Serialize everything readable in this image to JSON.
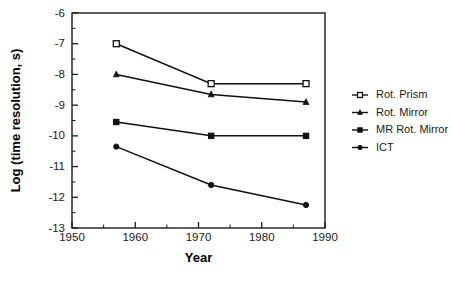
{
  "chart_data": {
    "type": "line",
    "title": "",
    "xlabel": "Year",
    "ylabel": "Log (time resolution, s)",
    "xlim": [
      1950,
      1990
    ],
    "ylim": [
      -13,
      -6
    ],
    "x_ticks": [
      1950,
      1960,
      1970,
      1980,
      1990
    ],
    "x_tick_labels": [
      "1950",
      "1960",
      "1970",
      "1980",
      "1990"
    ],
    "x_minor_ticks": [
      1955,
      1965,
      1975,
      1985
    ],
    "y_ticks": [
      -6,
      -7,
      -8,
      -9,
      -10,
      -11,
      -12,
      -13
    ],
    "y_tick_labels": [
      "-6",
      "-7",
      "-8",
      "-9",
      "-10",
      "-11",
      "-12",
      "-13"
    ],
    "y_minor_ticks": [
      -6.5,
      -7.5,
      -8.5,
      -9.5,
      -10.5,
      -11.5,
      -12.5
    ],
    "grid": false,
    "legend_position": "right",
    "series": [
      {
        "name": "Rot. Prism",
        "marker": "open-square",
        "x": [
          1957,
          1972,
          1987
        ],
        "values": [
          -7.0,
          -8.3,
          -8.3
        ]
      },
      {
        "name": "Rot. Mirror",
        "marker": "filled-triangle",
        "x": [
          1957,
          1972,
          1987
        ],
        "values": [
          -8.0,
          -8.65,
          -8.9
        ]
      },
      {
        "name": "MR Rot. Mirror",
        "marker": "filled-square",
        "x": [
          1957,
          1972,
          1987
        ],
        "values": [
          -9.55,
          -10.0,
          -10.0
        ]
      },
      {
        "name": "ICT",
        "marker": "filled-circle",
        "x": [
          1957,
          1972,
          1987
        ],
        "values": [
          -10.35,
          -11.6,
          -12.25
        ]
      }
    ]
  },
  "legend": {
    "entries": [
      {
        "label": "Rot. Prism"
      },
      {
        "label": "Rot. Mirror"
      },
      {
        "label": "MR Rot. Mirror"
      },
      {
        "label": "ICT"
      }
    ]
  },
  "axes": {
    "x_title": "Year",
    "y_title": "Log (time resolution, s)"
  }
}
